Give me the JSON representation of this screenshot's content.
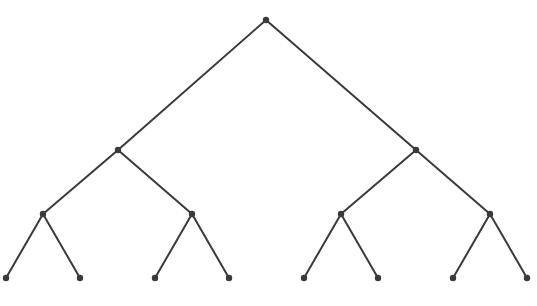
{
  "diagram": {
    "type": "binary-tree",
    "depth": 3,
    "colors": {
      "edge": "#3a3a3a",
      "node": "#3a3a3a",
      "background": "#ffffff"
    },
    "nodes": [
      {
        "id": "n0",
        "x": 266,
        "y": 20
      },
      {
        "id": "n1",
        "x": 118,
        "y": 150
      },
      {
        "id": "n2",
        "x": 416,
        "y": 150
      },
      {
        "id": "n3",
        "x": 43,
        "y": 214
      },
      {
        "id": "n4",
        "x": 192,
        "y": 214
      },
      {
        "id": "n5",
        "x": 341,
        "y": 214
      },
      {
        "id": "n6",
        "x": 490,
        "y": 214
      },
      {
        "id": "n7",
        "x": 6,
        "y": 278
      },
      {
        "id": "n8",
        "x": 80,
        "y": 278
      },
      {
        "id": "n9",
        "x": 155,
        "y": 278
      },
      {
        "id": "n10",
        "x": 229,
        "y": 278
      },
      {
        "id": "n11",
        "x": 304,
        "y": 278
      },
      {
        "id": "n12",
        "x": 378,
        "y": 278
      },
      {
        "id": "n13",
        "x": 453,
        "y": 278
      },
      {
        "id": "n14",
        "x": 527,
        "y": 278
      }
    ],
    "edges": [
      [
        "n0",
        "n1"
      ],
      [
        "n0",
        "n2"
      ],
      [
        "n1",
        "n3"
      ],
      [
        "n1",
        "n4"
      ],
      [
        "n2",
        "n5"
      ],
      [
        "n2",
        "n6"
      ],
      [
        "n3",
        "n7"
      ],
      [
        "n3",
        "n8"
      ],
      [
        "n4",
        "n9"
      ],
      [
        "n4",
        "n10"
      ],
      [
        "n5",
        "n11"
      ],
      [
        "n5",
        "n12"
      ],
      [
        "n6",
        "n13"
      ],
      [
        "n6",
        "n14"
      ]
    ]
  }
}
